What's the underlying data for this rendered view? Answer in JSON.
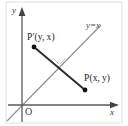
{
  "figure": {
    "kind": "coordinate-geometry-diagram",
    "colors": {
      "axis": "#555555",
      "mirror_line": "#8d8d8d",
      "segment": "#2a2a2a",
      "point": "#111111",
      "border": "#cfcfcf",
      "text": "#232323",
      "right_angle_mark": "#b6b6b6"
    },
    "axes": {
      "y_axis_label": "y",
      "x_axis_label": "x",
      "origin_label": "O"
    },
    "mirror_line": {
      "label": "y=x",
      "equation": "y = x"
    },
    "points": [
      {
        "id": "p-prime",
        "label": "P′(y, x)",
        "name_part": "P′",
        "coord_part": "(y, x)",
        "position_pct": {
          "x": 26,
          "y": 38
        }
      },
      {
        "id": "p",
        "label": "P(x, y)",
        "name_part": "P",
        "coord_part": "(x, y)",
        "position_pct": {
          "x": 66,
          "y": 72
        }
      }
    ],
    "segment": {
      "from": "p-prime",
      "to": "p",
      "right_angle_marked": true
    }
  }
}
